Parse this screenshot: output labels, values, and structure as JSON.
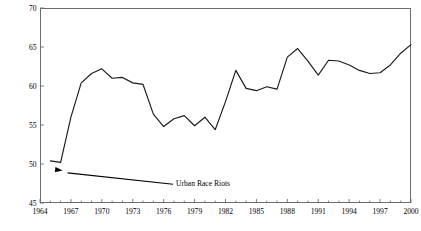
{
  "chart_data": {
    "type": "line",
    "title": "",
    "xlabel": "",
    "ylabel": "Support for Federal Aid to Cities (Percent)",
    "xlim": [
      1964,
      2000
    ],
    "ylim": [
      45,
      70
    ],
    "grid": false,
    "legend": "none",
    "y_ticks": [
      70,
      65,
      60,
      55,
      50,
      45
    ],
    "x_ticks": [
      1964,
      1967,
      1970,
      1973,
      1976,
      1979,
      1982,
      1985,
      1988,
      1991,
      1994,
      1997,
      2000
    ],
    "x_minor_tick_interval": 1,
    "line_color": "#1a1a1a",
    "series": [
      {
        "name": "Support for Federal Aid to Cities",
        "x": [
          1965,
          1966,
          1967,
          1968,
          1969,
          1970,
          1971,
          1972,
          1973,
          1974,
          1975,
          1976,
          1977,
          1978,
          1979,
          1980,
          1981,
          1982,
          1983,
          1984,
          1985,
          1986,
          1987,
          1988,
          1989,
          1990,
          1991,
          1992,
          1993,
          1994,
          1995,
          1996,
          1997,
          1998,
          1999,
          2000
        ],
        "values": [
          50.4,
          50.2,
          56.0,
          60.4,
          61.6,
          62.2,
          61.0,
          61.1,
          60.4,
          60.2,
          56.4,
          54.8,
          55.8,
          56.2,
          54.9,
          56.0,
          54.4,
          58.0,
          62.0,
          59.7,
          59.4,
          59.9,
          59.6,
          63.7,
          64.8,
          63.2,
          61.4,
          63.3,
          63.2,
          62.7,
          62.0,
          61.6,
          61.7,
          62.7,
          64.2,
          65.3
        ]
      }
    ],
    "annotations": [
      {
        "text": "Urban Race Riots",
        "target_x": 1966,
        "target_y": 50.2,
        "label_x": 1977.2,
        "label_y": 47.4,
        "arrow": true
      }
    ]
  }
}
